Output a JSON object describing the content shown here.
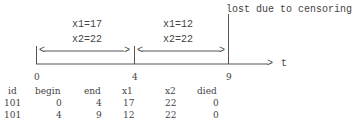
{
  "diagram": {
    "intervals": [
      {
        "x1_label": "x1=17",
        "x2_label": "x2=22",
        "left_arrow": "<",
        "right_arrow": ">"
      },
      {
        "x1_label": "x1=12",
        "x2_label": "x2=22",
        "left_arrow": "<",
        "right_arrow": ">"
      }
    ],
    "censor_label": "lost due to censoring",
    "axis_label": "t",
    "axis_arrow": ">",
    "ticks": [
      "0",
      "4",
      "9"
    ]
  },
  "table": {
    "headers": [
      "id",
      "begin",
      "end",
      "x1",
      "x2",
      "died"
    ],
    "rows": [
      [
        "101",
        "0",
        "4",
        "17",
        "22",
        "0"
      ],
      [
        "101",
        "4",
        "9",
        "12",
        "22",
        "0"
      ]
    ]
  },
  "colors": {
    "line": "#555555",
    "text": "#444444",
    "background": "#ffffff"
  }
}
